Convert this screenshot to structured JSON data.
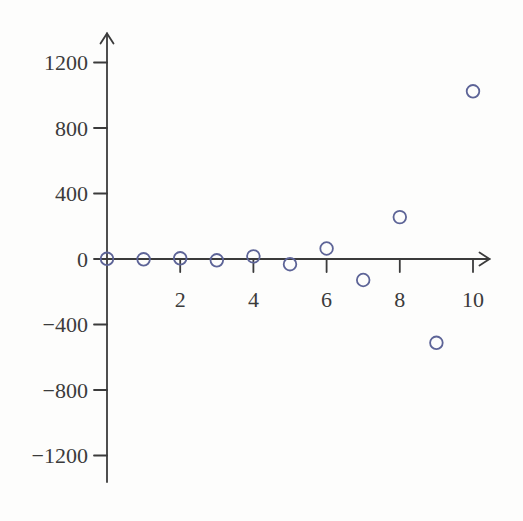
{
  "figure": {
    "background_color": "#fdfdfc"
  },
  "chart_data": {
    "type": "scatter",
    "title": "",
    "xlabel": "",
    "ylabel": "",
    "x": [
      0,
      1,
      2,
      3,
      4,
      5,
      6,
      7,
      8,
      9,
      10
    ],
    "y": [
      1,
      -2,
      4,
      -8,
      16,
      -32,
      64,
      -128,
      256,
      -512,
      1024
    ],
    "x_ticks": [
      2,
      4,
      6,
      8,
      10
    ],
    "x_tick_labels": [
      "2",
      "4",
      "6",
      "8",
      "10"
    ],
    "y_ticks": [
      1200,
      800,
      400,
      0,
      -400,
      -800,
      -1200
    ],
    "y_tick_labels": [
      "1200",
      "800",
      "400",
      "0",
      "−400",
      "−800",
      "−1200"
    ],
    "xlim": [
      0,
      10.5
    ],
    "ylim": [
      -1400,
      1380
    ],
    "grid": false,
    "legend": null,
    "marker": {
      "shape": "open-circle",
      "radius": 6.3,
      "stroke_width": 1.8,
      "color": "#5d6497"
    },
    "axis_color": "#3b3b3b",
    "label_color": "#3b3b3b"
  }
}
